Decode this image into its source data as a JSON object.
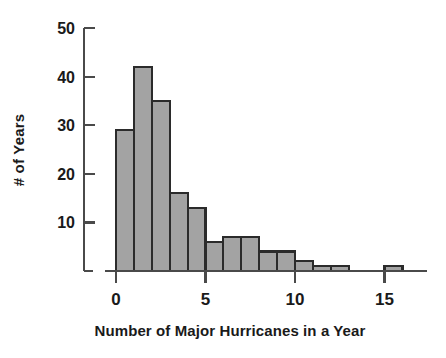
{
  "chart_data": {
    "type": "bar",
    "title": "",
    "subtitle": "",
    "xlabel": "Number of Major Hurricanes in a Year",
    "ylabel": "# of Years",
    "xlim": [
      -0.6,
      17.4
    ],
    "ylim": [
      0,
      50
    ],
    "grid": false,
    "legend": null,
    "bin_width": 1,
    "x_tick_labels": [
      "0",
      "5",
      "10",
      "15"
    ],
    "x_tick_values": [
      0,
      5,
      10,
      15
    ],
    "y_tick_labels": [
      "10",
      "20",
      "30",
      "40",
      "50"
    ],
    "y_tick_values": [
      10,
      20,
      30,
      40,
      50
    ],
    "categories": [
      "0-1",
      "1-2",
      "2-3",
      "3-4",
      "4-5",
      "5-6",
      "6-7",
      "7-8",
      "8-9",
      "9-10",
      "10-11",
      "11-12",
      "12-13",
      "13-14",
      "14-15",
      "15-16"
    ],
    "bin_left_edges": [
      0,
      1,
      2,
      3,
      4,
      5,
      6,
      7,
      8,
      9,
      10,
      11,
      12,
      13,
      14,
      15
    ],
    "values": [
      29,
      42,
      35,
      16,
      13,
      6,
      7,
      7,
      4,
      4,
      2,
      1,
      1,
      0,
      0,
      1
    ],
    "colors": {
      "bar_fill": "#a3a3a3",
      "bar_edge": "#2b2b2b",
      "axis": "#4a4a4a",
      "text": "#1a1a1a",
      "background": "#ffffff"
    }
  }
}
